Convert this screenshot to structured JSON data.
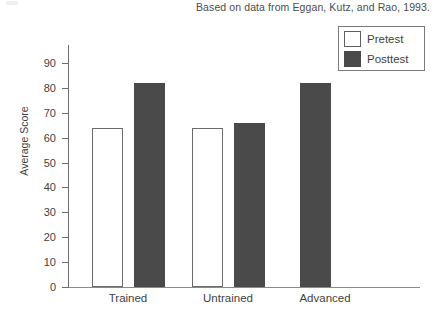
{
  "figure": {
    "source_note": "Based on data from Eggan, Kutz, and Rao, 1993.",
    "axis_title_y": "Average Score"
  },
  "legend": {
    "items": [
      {
        "label": "Pretest",
        "color": "#ffffff",
        "swatch": "pretest-swatch"
      },
      {
        "label": "Posttest",
        "color": "#4a4a4a",
        "swatch": "posttest-swatch"
      }
    ]
  },
  "yaxis": {
    "ticks": [
      {
        "label": "0"
      },
      {
        "label": "10"
      },
      {
        "label": "20"
      },
      {
        "label": "30"
      },
      {
        "label": "40"
      },
      {
        "label": "50"
      },
      {
        "label": "60"
      },
      {
        "label": "70"
      },
      {
        "label": "80"
      },
      {
        "label": "90"
      }
    ]
  },
  "xaxis": {
    "categories": [
      {
        "label": "Trained"
      },
      {
        "label": "Untrained"
      },
      {
        "label": "Advanced"
      }
    ]
  },
  "chart_data": {
    "type": "bar",
    "title": "",
    "subtitle": "",
    "xlabel": "",
    "ylabel": "Average Score",
    "categories": [
      "Trained",
      "Untrained",
      "Advanced"
    ],
    "series": [
      {
        "name": "Pretest",
        "color": "#ffffff",
        "values": [
          64,
          64,
          null
        ]
      },
      {
        "name": "Posttest",
        "color": "#4a4a4a",
        "values": [
          82,
          66,
          82
        ]
      }
    ],
    "ylim": [
      0,
      90
    ],
    "ytick_step": 10,
    "grid": false,
    "legend_position": "top-right",
    "annotations": [
      "Based on data from Eggan, Kutz, and Rao, 1993."
    ]
  }
}
